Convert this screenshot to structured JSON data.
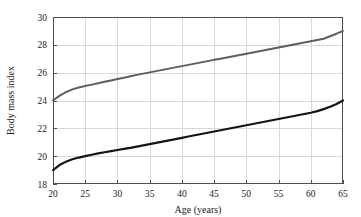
{
  "chart_data": {
    "type": "line",
    "title": "",
    "subtitle": "",
    "xlabel": "Age (years)",
    "ylabel": "Body mass index",
    "xlim": [
      20,
      65
    ],
    "ylim": [
      18,
      30
    ],
    "xticks": [
      20,
      25,
      30,
      35,
      40,
      45,
      50,
      55,
      60,
      65
    ],
    "yticks": [
      18,
      20,
      22,
      24,
      26,
      28,
      30
    ],
    "xtick_labels": [
      "20",
      "25",
      "30",
      "35",
      "40",
      "45",
      "50",
      "55",
      "60",
      "65"
    ],
    "ytick_labels": [
      "18",
      "20",
      "22",
      "24",
      "26",
      "28",
      "30"
    ],
    "grid": true,
    "grid_color": "#d8d8d8",
    "legend": false,
    "legend_position": "none",
    "background_color": "#ffffff",
    "frame_color": "#4d4d4d",
    "x": [
      20,
      21,
      22,
      23,
      24,
      25,
      26,
      27,
      28,
      29,
      30,
      31,
      32,
      33,
      34,
      35,
      36,
      37,
      38,
      39,
      40,
      41,
      42,
      43,
      44,
      45,
      46,
      47,
      48,
      49,
      50,
      51,
      52,
      53,
      54,
      55,
      56,
      57,
      58,
      59,
      60,
      61,
      62,
      63,
      64,
      65
    ],
    "series": [
      {
        "name": "upper-curve",
        "color": "#5e5e5e",
        "line_width": 2.0,
        "values": [
          24.0,
          24.33,
          24.6,
          24.8,
          24.94,
          25.04,
          25.14,
          25.24,
          25.34,
          25.44,
          25.54,
          25.64,
          25.74,
          25.84,
          25.93,
          26.02,
          26.11,
          26.2,
          26.29,
          26.38,
          26.47,
          26.56,
          26.65,
          26.74,
          26.83,
          26.92,
          27.0,
          27.09,
          27.18,
          27.27,
          27.36,
          27.45,
          27.54,
          27.63,
          27.72,
          27.81,
          27.9,
          27.99,
          28.08,
          28.17,
          28.26,
          28.35,
          28.44,
          28.62,
          28.8,
          29.0
        ]
      },
      {
        "name": "lower-curve",
        "color": "#141414",
        "line_width": 2.2,
        "values": [
          19.0,
          19.36,
          19.6,
          19.78,
          19.9,
          20.0,
          20.1,
          20.2,
          20.28,
          20.36,
          20.44,
          20.52,
          20.6,
          20.69,
          20.78,
          20.87,
          20.96,
          21.05,
          21.14,
          21.23,
          21.32,
          21.41,
          21.5,
          21.59,
          21.68,
          21.77,
          21.86,
          21.95,
          22.04,
          22.13,
          22.22,
          22.31,
          22.4,
          22.49,
          22.58,
          22.67,
          22.76,
          22.85,
          22.94,
          23.03,
          23.12,
          23.24,
          23.38,
          23.55,
          23.75,
          24.0
        ]
      }
    ]
  },
  "plot_geometry": {
    "left": 53,
    "right": 343,
    "top": 17,
    "bottom": 184
  }
}
